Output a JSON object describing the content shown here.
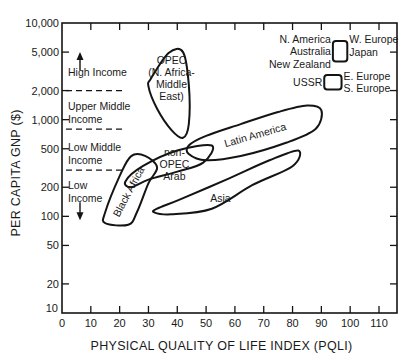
{
  "chart_data": {
    "type": "scatter",
    "title": "",
    "xlabel": "PHYSICAL QUALITY OF LIFE INDEX (PQLI)",
    "ylabel": "PER CAPITA GNP ($)",
    "xlim": [
      0,
      114
    ],
    "ylim": [
      10,
      10000
    ],
    "yscale": "log",
    "grid": false,
    "x_ticks": [
      0,
      10,
      20,
      30,
      40,
      50,
      60,
      70,
      80,
      90,
      100,
      110
    ],
    "x_tick_labels": [
      "0",
      "10",
      "20",
      "30",
      "40",
      "50",
      "60",
      "70",
      "80",
      "90",
      "100",
      "110"
    ],
    "y_ticks": [
      10,
      20,
      50,
      100,
      200,
      500,
      1000,
      2000,
      5000,
      10000
    ],
    "y_tick_labels": [
      "10",
      "20",
      "50",
      "100",
      "200",
      "500",
      "1,000",
      "2,000",
      "5,000",
      "10,000"
    ],
    "income_bands": [
      {
        "label": [
          "High Income"
        ],
        "arrow": "up",
        "lower_bound": 2000
      },
      {
        "label": [
          "Upper Middle",
          "Income"
        ],
        "lower_bound": 800
      },
      {
        "label": [
          "Low Middle",
          "Income"
        ],
        "lower_bound": 300
      },
      {
        "label": [
          "Low",
          "Income"
        ],
        "arrow": "down"
      }
    ],
    "regions": [
      {
        "name": "OPEC (N. Africa-Middle East)",
        "label_lines": [
          "OPEC",
          "(N. Africa-",
          "Middle",
          "East)"
        ],
        "outline": [
          [
            31,
            2700
          ],
          [
            37,
            4900
          ],
          [
            42,
            5000
          ],
          [
            44,
            2300
          ],
          [
            44,
            900
          ],
          [
            42,
            650
          ],
          [
            38,
            780
          ],
          [
            33,
            1300
          ],
          [
            30,
            2200
          ]
        ],
        "label_at": [
          38,
          2700
        ]
      },
      {
        "name": "Latin America",
        "label_lines": [
          "Latin America"
        ],
        "outline": [
          [
            44,
            540
          ],
          [
            50,
            680
          ],
          [
            62,
            900
          ],
          [
            75,
            1200
          ],
          [
            85,
            1400
          ],
          [
            90,
            1250
          ],
          [
            88,
            800
          ],
          [
            78,
            580
          ],
          [
            62,
            420
          ],
          [
            50,
            380
          ],
          [
            44,
            440
          ]
        ],
        "label_at": [
          67,
          700
        ]
      },
      {
        "name": "Black Africa",
        "label_lines": [
          "Black Africa"
        ],
        "outline": [
          [
            15,
            85
          ],
          [
            23,
            82
          ],
          [
            26,
            110
          ],
          [
            30,
            220
          ],
          [
            33,
            320
          ],
          [
            29,
            420
          ],
          [
            24,
            420
          ],
          [
            20,
            260
          ],
          [
            15,
            110
          ]
        ],
        "label_at": [
          23,
          180
        ]
      },
      {
        "name": "non-OPEC Arab",
        "label_lines": [
          "non-",
          "OPEC",
          "Arab"
        ],
        "outline": [
          [
            22,
            230
          ],
          [
            28,
            330
          ],
          [
            40,
            480
          ],
          [
            52,
            540
          ],
          [
            49,
            360
          ],
          [
            40,
            290
          ],
          [
            30,
            240
          ],
          [
            24,
            200
          ]
        ],
        "label_at": [
          39,
          350
        ]
      },
      {
        "name": "Asia",
        "label_lines": [
          "Asia"
        ],
        "outline": [
          [
            33,
            120
          ],
          [
            41,
            150
          ],
          [
            57,
            240
          ],
          [
            72,
            380
          ],
          [
            82,
            480
          ],
          [
            80,
            330
          ],
          [
            66,
            210
          ],
          [
            52,
            120
          ],
          [
            38,
            105
          ],
          [
            32,
            110
          ]
        ],
        "label_at": [
          55,
          155
        ]
      },
      {
        "name": "N. America, Australia, New Zealand / W. Europe, Japan",
        "label_left": [
          "N. America",
          "Australia",
          "New Zealand"
        ],
        "label_right": [
          "W. Europe",
          "Japan"
        ],
        "outline": [
          [
            94,
            6500
          ],
          [
            99,
            6500
          ],
          [
            99,
            4000
          ],
          [
            94,
            4000
          ]
        ]
      },
      {
        "name": "USSR / E. Europe, S. Europe",
        "label_left": [
          "USSR"
        ],
        "label_right": [
          "E. Europe",
          "S. Europe"
        ],
        "outline": [
          [
            91,
            2900
          ],
          [
            97,
            2900
          ],
          [
            97,
            2050
          ],
          [
            91,
            2050
          ]
        ]
      }
    ]
  }
}
